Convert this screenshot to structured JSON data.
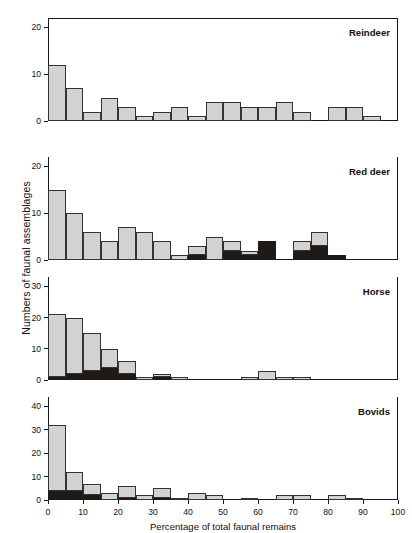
{
  "figure": {
    "xlabel": "Percentage of total faunal remains",
    "ylabel": "Numbers of faunal assemblages",
    "x_ticks": [
      "0",
      "10",
      "20",
      "30",
      "40",
      "50",
      "60",
      "70",
      "80",
      "90",
      "100"
    ]
  },
  "chart_data": {
    "type": "bar",
    "title": "",
    "xlabel": "Percentage of total faunal remains",
    "ylabel": "Numbers of faunal assemblages",
    "xlim": [
      0,
      100
    ],
    "grid": false,
    "legend": "none",
    "bin_width": 5,
    "stacked": true,
    "series_names": [
      "dark",
      "light"
    ],
    "series_colors": {
      "dark": "#201a16",
      "light": "#d2d2d2"
    },
    "panels": [
      {
        "name": "Reindeer",
        "ylim": [
          0,
          22
        ],
        "y_ticks": [
          "0",
          "10",
          "20"
        ],
        "y_tick_values": [
          0,
          10,
          20
        ],
        "bins": [
          0,
          5,
          10,
          15,
          20,
          25,
          30,
          35,
          40,
          45,
          50,
          55,
          60,
          65,
          70,
          75,
          80,
          85,
          90,
          95
        ],
        "dark": [
          0,
          0,
          0,
          0,
          0,
          0,
          0,
          0,
          0,
          0,
          0,
          0,
          0,
          0,
          0,
          0,
          0,
          0,
          0,
          0
        ],
        "light": [
          12,
          7,
          2,
          5,
          3,
          1,
          2,
          3,
          1,
          4,
          4,
          3,
          3,
          4,
          2,
          0,
          3,
          3,
          1,
          0
        ],
        "totals": [
          12,
          7,
          2,
          5,
          3,
          1,
          2,
          3,
          1,
          4,
          4,
          3,
          3,
          4,
          2,
          0,
          3,
          3,
          1,
          0
        ]
      },
      {
        "name": "Red deer",
        "ylim": [
          0,
          22
        ],
        "y_ticks": [
          "0",
          "10",
          "20"
        ],
        "y_tick_values": [
          0,
          10,
          20
        ],
        "bins": [
          0,
          5,
          10,
          15,
          20,
          25,
          30,
          35,
          40,
          45,
          50,
          55,
          60,
          65,
          70,
          75,
          80,
          85,
          90,
          95
        ],
        "dark": [
          0,
          0,
          0,
          0,
          0,
          0,
          0,
          0,
          1,
          0,
          2,
          1,
          4,
          0,
          2,
          3,
          1,
          0,
          0,
          0
        ],
        "light": [
          15,
          10,
          6,
          4,
          7,
          6,
          4,
          1,
          2,
          5,
          2,
          1,
          0,
          0,
          2,
          3,
          0,
          0,
          0,
          0
        ],
        "totals": [
          15,
          10,
          6,
          4,
          7,
          6,
          4,
          1,
          3,
          5,
          4,
          2,
          4,
          0,
          4,
          6,
          1,
          0,
          0,
          0
        ]
      },
      {
        "name": "Horse",
        "ylim": [
          0,
          33
        ],
        "y_ticks": [
          "0",
          "10",
          "20",
          "30"
        ],
        "y_tick_values": [
          0,
          10,
          20,
          30
        ],
        "bins": [
          0,
          5,
          10,
          15,
          20,
          25,
          30,
          35,
          40,
          45,
          50,
          55,
          60,
          65,
          70,
          75,
          80,
          85,
          90,
          95
        ],
        "dark": [
          1,
          2,
          3,
          4,
          2,
          0,
          1,
          0,
          0,
          0,
          0,
          0,
          0,
          0,
          0,
          0,
          0,
          0,
          0,
          0
        ],
        "light": [
          20,
          18,
          12,
          6,
          4,
          1,
          1,
          1,
          0,
          0,
          0,
          1,
          3,
          1,
          1,
          0,
          0,
          0,
          0,
          0
        ],
        "totals": [
          21,
          20,
          15,
          10,
          6,
          1,
          2,
          1,
          0,
          0,
          0,
          1,
          3,
          1,
          1,
          0,
          0,
          0,
          0,
          0
        ]
      },
      {
        "name": "Bovids",
        "ylim": [
          0,
          44
        ],
        "y_ticks": [
          "0",
          "10",
          "20",
          "30",
          "40"
        ],
        "y_tick_values": [
          0,
          10,
          20,
          30,
          40
        ],
        "bins": [
          0,
          5,
          10,
          15,
          20,
          25,
          30,
          35,
          40,
          45,
          50,
          55,
          60,
          65,
          70,
          75,
          80,
          85,
          90,
          95
        ],
        "dark": [
          4,
          4,
          2,
          0,
          1,
          0,
          1,
          0,
          0,
          0,
          0,
          0,
          0,
          0,
          0,
          0,
          0,
          0,
          0,
          0
        ],
        "light": [
          28,
          8,
          5,
          3,
          5,
          2,
          4,
          1,
          3,
          2,
          0,
          1,
          0,
          2,
          2,
          0,
          2,
          1,
          0,
          0
        ],
        "totals": [
          32,
          12,
          7,
          3,
          6,
          2,
          5,
          1,
          3,
          2,
          0,
          1,
          0,
          2,
          2,
          0,
          2,
          1,
          0,
          0
        ]
      }
    ]
  }
}
